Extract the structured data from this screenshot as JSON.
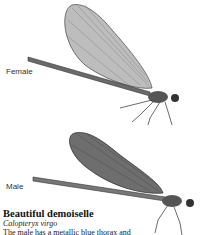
{
  "labels": {
    "female": "Female",
    "male": "Male"
  },
  "species": {
    "common_name": "Beautiful demoiselle",
    "latin_name": "Calopteryx virgo",
    "description": "The male has a metallic blue thorax and"
  },
  "illustrations": [
    {
      "name": "female-demoiselle-illustration",
      "wing_color": "#9a9a9a"
    },
    {
      "name": "male-demoiselle-illustration",
      "wing_color": "#555555"
    }
  ]
}
